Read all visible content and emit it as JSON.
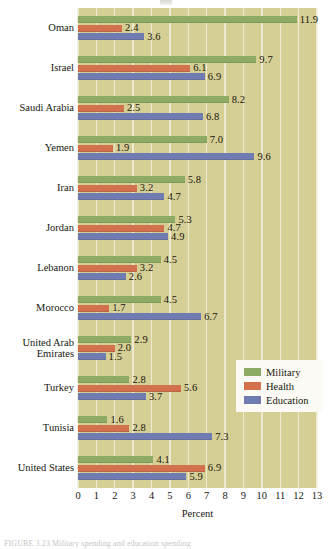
{
  "figure": {
    "xlabel": "Percent",
    "caption": "FIGURE 3.23 Military spending and education spending",
    "legend_title": ""
  },
  "legend": {
    "items": [
      {
        "label": "Military",
        "color": "#8eab66"
      },
      {
        "label": "Health",
        "color": "#d2714c"
      },
      {
        "label": "Education",
        "color": "#6f7cb1"
      }
    ]
  },
  "axis": {
    "ticks": [
      "0",
      "1",
      "2",
      "3",
      "4",
      "5",
      "6",
      "7",
      "8",
      "9",
      "10",
      "11",
      "12",
      "13"
    ],
    "min": 0,
    "max": 13
  },
  "chart_data": {
    "type": "bar",
    "orientation": "horizontal",
    "title": "",
    "xlabel": "Percent",
    "ylabel": "",
    "xlim": [
      0,
      13
    ],
    "grid": true,
    "legend_position": "inside-right-lower",
    "categories": [
      "Oman",
      "Israel",
      "Saudi Arabia",
      "Yemen",
      "Iran",
      "Jordan",
      "Lebanon",
      "Morocco",
      "United Arab\nEmirates",
      "Turkey",
      "Tunisia",
      "United States"
    ],
    "series": [
      {
        "name": "Military",
        "color": "#8eab66",
        "values": [
          11.9,
          9.7,
          8.2,
          7.0,
          5.8,
          5.3,
          4.5,
          4.5,
          2.9,
          2.8,
          1.6,
          4.1
        ]
      },
      {
        "name": "Health",
        "color": "#d2714c",
        "values": [
          2.4,
          6.1,
          2.5,
          1.9,
          3.2,
          4.7,
          3.2,
          1.7,
          2.0,
          5.6,
          2.8,
          6.9
        ]
      },
      {
        "name": "Education",
        "color": "#6f7cb1",
        "values": [
          3.6,
          6.9,
          6.8,
          9.6,
          4.7,
          4.9,
          2.6,
          6.7,
          1.5,
          3.7,
          7.3,
          5.9
        ]
      }
    ]
  }
}
